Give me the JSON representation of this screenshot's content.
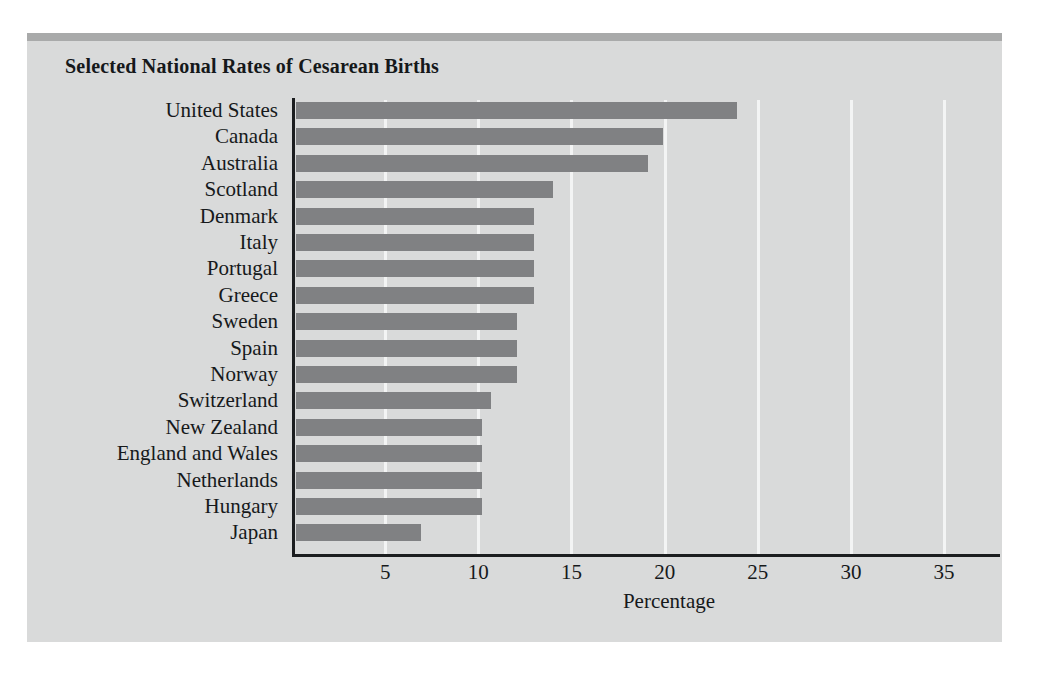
{
  "chart_data": {
    "type": "bar",
    "orientation": "horizontal",
    "title": "Selected National Rates of Cesarean Births",
    "xlabel": "Percentage",
    "ylabel": "",
    "grid": "vertical-major",
    "legend": "none",
    "xlim": [
      0,
      38
    ],
    "xticks": [
      5,
      10,
      15,
      20,
      25,
      30,
      35
    ],
    "xtick_labels": [
      "5",
      "10",
      "15",
      "20",
      "25",
      "30",
      "35"
    ],
    "categories": [
      "United States",
      "Canada",
      "Australia",
      "Scotland",
      "Denmark",
      "Italy",
      "Portugal",
      "Greece",
      "Sweden",
      "Spain",
      "Norway",
      "Switzerland",
      "New Zealand",
      "England and Wales",
      "Netherlands",
      "Hungary",
      "Japan"
    ],
    "values": [
      23.9,
      19.9,
      19.1,
      14.0,
      13.0,
      13.0,
      13.0,
      13.0,
      12.1,
      12.1,
      12.1,
      10.7,
      10.2,
      10.2,
      10.2,
      10.2,
      6.9
    ]
  },
  "style": {
    "bar_color": "#808183",
    "panel_color": "#d9dada",
    "panel_top_strip_color": "#a9aaaa",
    "gridline_color": "#f3f4f4",
    "axis_color": "#1b1d1f",
    "text_color": "#16191b",
    "page_background": "#ffffff"
  }
}
